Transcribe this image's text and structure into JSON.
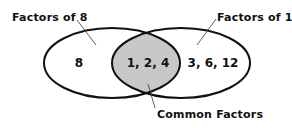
{
  "diagram": {
    "type": "venn",
    "sets": [
      {
        "id": "left",
        "label": "Factors of 8",
        "only_values": "8"
      },
      {
        "id": "right",
        "label": "Factors of 12",
        "only_values": "3, 6, 12"
      }
    ],
    "intersection": {
      "label": "Common Factors",
      "values": "1, 2, 4",
      "fill": "#c8c8c8"
    },
    "colors": {
      "stroke": "#111111",
      "background": "#ffffff",
      "text": "#111111"
    }
  }
}
